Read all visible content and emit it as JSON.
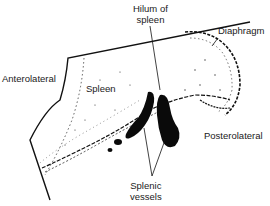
{
  "diagram": {
    "colors": {
      "ink": "#111111",
      "background": "#ffffff",
      "text": "#1a1a1a"
    },
    "labels": {
      "hilum_line1": "Hilum of",
      "hilum_line2": "spleen",
      "diaphragm": "Diaphragm",
      "anterolateral": "Anterolateral",
      "spleen": "Spleen",
      "posterolateral": "Posterolateral",
      "vessels_line1": "Splenic",
      "vessels_line2": "vessels"
    }
  }
}
